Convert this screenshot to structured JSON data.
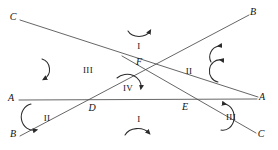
{
  "figure": {
    "type": "geometry-diagram",
    "width": 278,
    "height": 150,
    "stroke_color": "#3a3a3a",
    "text_color": "#111111",
    "background": "#ffffff"
  },
  "points": [
    {
      "id": "p-C-top",
      "label": "C",
      "x": 13,
      "y": 17
    },
    {
      "id": "p-B-top",
      "label": "B",
      "x": 253,
      "y": 12
    },
    {
      "id": "p-A-left",
      "label": "A",
      "x": 11,
      "y": 98
    },
    {
      "id": "p-A-right",
      "label": "A",
      "x": 262,
      "y": 97
    },
    {
      "id": "p-B-bottom",
      "label": "B",
      "x": 13,
      "y": 134
    },
    {
      "id": "p-C-bottom",
      "label": "C",
      "x": 261,
      "y": 134
    },
    {
      "id": "p-D",
      "label": "D",
      "x": 92,
      "y": 108
    },
    {
      "id": "p-E",
      "label": "E",
      "x": 185,
      "y": 107
    },
    {
      "id": "p-F",
      "label": "F",
      "x": 139,
      "y": 62
    }
  ],
  "regions": [
    {
      "id": "region-top",
      "label": "I",
      "x": 139,
      "y": 46
    },
    {
      "id": "region-right",
      "label": "II",
      "x": 189,
      "y": 71
    },
    {
      "id": "region-left",
      "label": "III",
      "x": 88,
      "y": 70
    },
    {
      "id": "region-center",
      "label": "IV",
      "x": 128,
      "y": 88
    },
    {
      "id": "region-bottom",
      "label": "I",
      "x": 139,
      "y": 119
    },
    {
      "id": "region-bottom-left",
      "label": "II",
      "x": 47,
      "y": 118
    },
    {
      "id": "region-bottom-right",
      "label": "III",
      "x": 231,
      "y": 117
    }
  ],
  "lines": [
    {
      "id": "line-C-to-A-right",
      "from": "C (top-left)",
      "to": "A (right)"
    },
    {
      "id": "line-B-to-B",
      "from": "B (bottom-left)",
      "to": "B (top-right)"
    },
    {
      "id": "line-A-left-to-A-right",
      "from": "A (left)",
      "to": "A (right)"
    },
    {
      "id": "line-to-C-bottom",
      "from": "F",
      "to": "C (bottom-right)"
    }
  ],
  "arcs": [
    {
      "id": "arc-top",
      "description": "arc above center, opens upward"
    },
    {
      "id": "arc-upper-right",
      "description": "arc in upper right area"
    },
    {
      "id": "arc-upper-left",
      "description": "arc in upper left area"
    },
    {
      "id": "arc-right",
      "description": "arc right of region II"
    },
    {
      "id": "arc-center",
      "description": "arc around region IV at F"
    },
    {
      "id": "arc-bottom",
      "description": "arc below center under region I"
    },
    {
      "id": "arc-bottom-left",
      "description": "arc at bottom-left near region II"
    },
    {
      "id": "arc-bottom-right",
      "description": "arc at bottom-right near region III"
    }
  ]
}
